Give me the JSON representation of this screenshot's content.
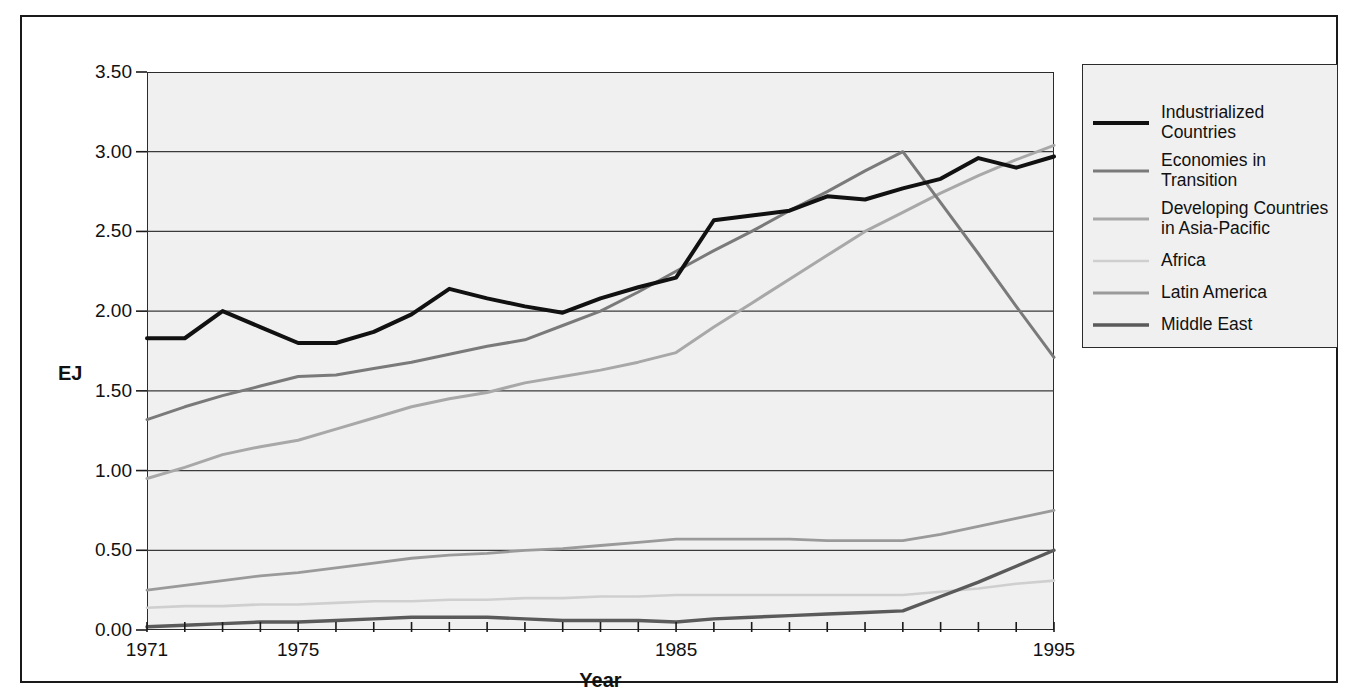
{
  "chart_data": {
    "type": "line",
    "title": "",
    "xlabel": "Year",
    "ylabel": "EJ",
    "xlim": [
      1971,
      1995
    ],
    "ylim": [
      0.0,
      3.5
    ],
    "yticks": [
      "0.00",
      "0.50",
      "1.00",
      "1.50",
      "2.00",
      "2.50",
      "3.00",
      "3.50"
    ],
    "ytick_values": [
      0.0,
      0.5,
      1.0,
      1.5,
      2.0,
      2.5,
      3.0,
      3.5
    ],
    "xticks": [
      "1971",
      "1975",
      "1985",
      "1995"
    ],
    "xtick_values": [
      1971,
      1975,
      1985,
      1995
    ],
    "grid": "horizontal",
    "legend_position": "right",
    "x": [
      1971,
      1972,
      1973,
      1974,
      1975,
      1976,
      1977,
      1978,
      1979,
      1980,
      1981,
      1982,
      1983,
      1984,
      1985,
      1986,
      1987,
      1988,
      1989,
      1990,
      1991,
      1992,
      1993,
      1994,
      1995
    ],
    "series": [
      {
        "name": "Industrialized Countries",
        "color": "#111111",
        "width": 4.0,
        "values": [
          1.83,
          1.83,
          2.0,
          1.9,
          1.8,
          1.8,
          1.87,
          1.98,
          2.14,
          2.08,
          2.03,
          1.99,
          2.08,
          2.15,
          2.21,
          2.57,
          2.6,
          2.63,
          2.72,
          2.7,
          2.77,
          2.83,
          2.96,
          2.9,
          2.97
        ]
      },
      {
        "name": "Economies in Transition",
        "color": "#7a7a7a",
        "width": 3.0,
        "values": [
          1.32,
          1.4,
          1.47,
          1.53,
          1.59,
          1.6,
          1.64,
          1.68,
          1.73,
          1.78,
          1.82,
          1.91,
          2.0,
          2.12,
          2.25,
          2.38,
          2.5,
          2.63,
          2.75,
          2.88,
          3.0,
          2.68,
          2.36,
          2.03,
          1.71
        ]
      },
      {
        "name": "Developing Countries in Asia-Pacific",
        "color": "#a8a8a8",
        "width": 3.0,
        "values": [
          0.95,
          1.02,
          1.1,
          1.15,
          1.19,
          1.26,
          1.33,
          1.4,
          1.45,
          1.49,
          1.55,
          1.59,
          1.63,
          1.68,
          1.74,
          1.9,
          2.05,
          2.2,
          2.35,
          2.5,
          2.62,
          2.74,
          2.85,
          2.95,
          3.04
        ]
      },
      {
        "name": "Africa",
        "color": "#cfcfcf",
        "width": 2.6,
        "values": [
          0.14,
          0.15,
          0.15,
          0.16,
          0.16,
          0.17,
          0.18,
          0.18,
          0.19,
          0.19,
          0.2,
          0.2,
          0.21,
          0.21,
          0.22,
          0.22,
          0.22,
          0.22,
          0.22,
          0.22,
          0.22,
          0.24,
          0.26,
          0.29,
          0.31
        ]
      },
      {
        "name": "Latin America",
        "color": "#9a9a9a",
        "width": 2.8,
        "values": [
          0.25,
          0.28,
          0.31,
          0.34,
          0.36,
          0.39,
          0.42,
          0.45,
          0.47,
          0.48,
          0.5,
          0.51,
          0.53,
          0.55,
          0.57,
          0.57,
          0.57,
          0.57,
          0.56,
          0.56,
          0.56,
          0.6,
          0.65,
          0.7,
          0.75
        ]
      },
      {
        "name": "Middle East",
        "color": "#5a5a5a",
        "width": 3.4,
        "values": [
          0.02,
          0.03,
          0.04,
          0.05,
          0.05,
          0.06,
          0.07,
          0.08,
          0.08,
          0.08,
          0.07,
          0.06,
          0.06,
          0.06,
          0.05,
          0.07,
          0.08,
          0.09,
          0.1,
          0.11,
          0.12,
          0.21,
          0.3,
          0.4,
          0.5
        ]
      }
    ]
  }
}
